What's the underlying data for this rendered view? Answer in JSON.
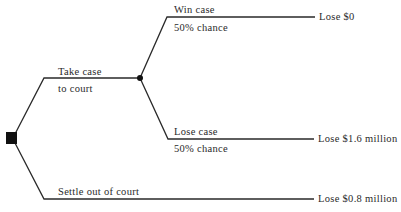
{
  "diagram": {
    "type": "decision-tree",
    "root": {
      "node_type": "decision",
      "shape": "square"
    },
    "branches": [
      {
        "label_line1": "Take case",
        "label_line2": "to court",
        "child": {
          "node_type": "chance",
          "shape": "circle",
          "outcomes": [
            {
              "label_line1": "Win case",
              "label_line2": "50% chance",
              "result": "Lose $0"
            },
            {
              "label_line1": "Lose case",
              "label_line2": "50% chance",
              "result": "Lose $1.6 million"
            }
          ]
        }
      },
      {
        "label_line1": "Settle out of court",
        "result": "Lose $0.8 million"
      }
    ],
    "colors": {
      "line": "#2a2a2a",
      "node": "#111111",
      "text": "#2a2a2a"
    }
  }
}
